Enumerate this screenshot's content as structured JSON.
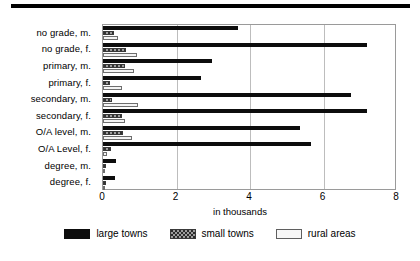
{
  "chart_data": {
    "type": "bar",
    "orientation": "horizontal",
    "title": "",
    "xlabel": "in thousands",
    "ylabel": "",
    "xlim": [
      0,
      8
    ],
    "xticks": [
      0,
      2,
      4,
      6,
      8
    ],
    "grid": true,
    "legend_position": "bottom",
    "categories": [
      "no grade, m.",
      "no grade, f.",
      "primary, m.",
      "primary, f.",
      "secondary, m.",
      "secondary, f.",
      "O/A level, m.",
      "O/A Level, f.",
      "degree, m.",
      "degree, f."
    ],
    "series": [
      {
        "name": "large towns",
        "color": "#0d0d0d",
        "values": [
          3.67,
          7.18,
          2.97,
          2.67,
          6.75,
          7.18,
          5.35,
          5.67,
          0.35,
          0.33
        ]
      },
      {
        "name": "small towns",
        "color": "#9d9d9d",
        "values": [
          0.3,
          0.62,
          0.6,
          0.18,
          0.24,
          0.52,
          0.55,
          0.22,
          0.07,
          0.07
        ]
      },
      {
        "name": "rural areas",
        "color": "#f4f4f4",
        "values": [
          0.4,
          0.92,
          0.85,
          0.52,
          0.95,
          0.6,
          0.78,
          0.1,
          0.05,
          0.05
        ]
      }
    ]
  },
  "legend": {
    "items": [
      {
        "label": "large towns",
        "key": "large"
      },
      {
        "label": "small towns",
        "key": "small"
      },
      {
        "label": "rural areas",
        "key": "rural"
      }
    ]
  }
}
